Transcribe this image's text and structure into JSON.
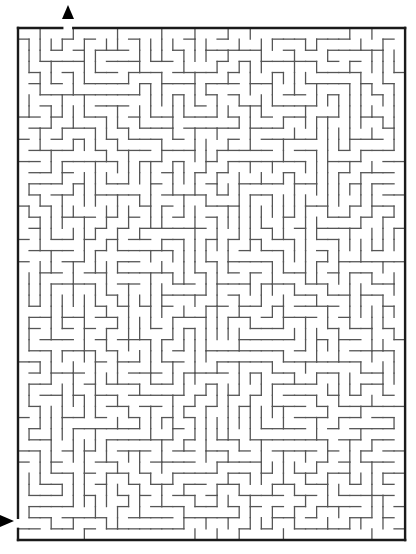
{
  "maze": {
    "left": 18,
    "top": 28,
    "cols": 35,
    "rows": 46,
    "cell_w": 11.06,
    "cell_h": 11.13,
    "seed": 1337,
    "entrance": {
      "side": "top",
      "col": 4,
      "label": "start"
    },
    "exit": {
      "side": "left",
      "row": 44,
      "label": "finish"
    },
    "colors": {
      "wall": "#555555",
      "border": "#1a1a1a",
      "arrow": "#000000",
      "background": "#ffffff"
    }
  },
  "markers": {
    "top_arrow": {
      "direction": "up",
      "x": 68,
      "y": 12
    },
    "left_arrow": {
      "direction": "right",
      "x": 6,
      "y": 521
    }
  }
}
